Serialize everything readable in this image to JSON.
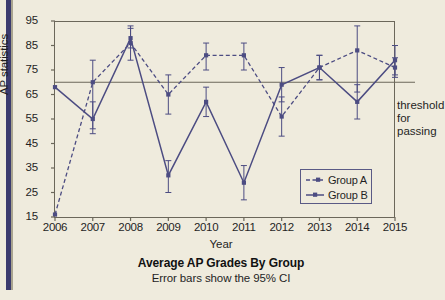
{
  "chart_data": {
    "type": "line",
    "title": "Average AP Grades By Group",
    "subtitle": "Error bars show the 95% CI",
    "xlabel": "Year",
    "ylabel": "AP statistics",
    "categories": [
      "2006",
      "2007",
      "2008",
      "2009",
      "2010",
      "2011",
      "2012",
      "2013",
      "2014",
      "2015"
    ],
    "xlim": [
      2006,
      2015
    ],
    "ylim": [
      15,
      95
    ],
    "yticks": [
      15,
      25,
      35,
      45,
      55,
      65,
      75,
      85,
      95
    ],
    "grid": false,
    "legend_position": "lower-right",
    "annotations": [
      {
        "text": "threshold for passing",
        "y": 70,
        "type": "hline-label"
      }
    ],
    "hline": {
      "value": 70,
      "label_line1": "threshold",
      "label_line2": "for passing"
    },
    "series": [
      {
        "name": "Group A",
        "style": "dashed",
        "color": "#4c4c82",
        "values": [
          16,
          70,
          86,
          65,
          81,
          81,
          56,
          76,
          83,
          76
        ],
        "err_low": [
          16,
          51,
          79,
          57,
          75,
          75,
          48,
          71,
          66,
          72
        ],
        "err_high": [
          16,
          79,
          93,
          73,
          86,
          86,
          64,
          81,
          93,
          80
        ]
      },
      {
        "name": "Group B",
        "style": "solid",
        "color": "#4c4c82",
        "values": [
          68,
          55,
          88,
          32,
          62,
          29,
          69,
          76,
          62,
          79
        ],
        "err_low": [
          68,
          49,
          84,
          25,
          56,
          22,
          62,
          71,
          55,
          73
        ],
        "err_high": [
          68,
          62,
          92,
          38,
          68,
          36,
          76,
          81,
          69,
          85
        ]
      }
    ]
  },
  "legend": {
    "items": [
      {
        "label": "Group A",
        "style": "dashed"
      },
      {
        "label": "Group B",
        "style": "solid"
      }
    ]
  },
  "colors": {
    "background": "#efebdd",
    "series": "#4c4c82",
    "axis": "#6b675a",
    "spine": "#3b3b6e",
    "text": "#1f1f1f"
  }
}
